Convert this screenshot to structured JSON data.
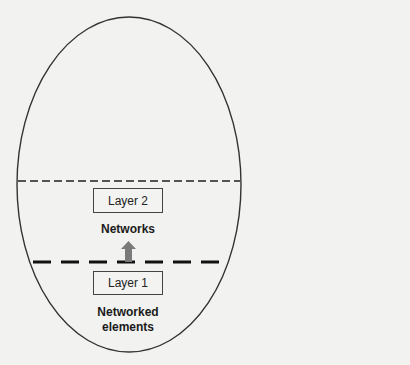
{
  "diagram": {
    "type": "layered-network-ellipse",
    "boxes": [
      {
        "id": "layer-2",
        "label": "Layer 2"
      },
      {
        "id": "layer-1",
        "label": "Layer 1"
      }
    ],
    "labels": {
      "networks": "Networks",
      "networked_elements_line1": "Networked",
      "networked_elements_line2": "elements"
    },
    "connectors": [
      {
        "from": "layer-1",
        "to": "layer-2",
        "kind": "upward-arrow",
        "color": "#7a7a7a"
      }
    ],
    "boundaries": [
      {
        "name": "upper-boundary",
        "style": "thin-dashed"
      },
      {
        "name": "lower-boundary",
        "style": "thick-dashed"
      }
    ],
    "colors": {
      "stroke": "#333333",
      "arrow": "#7a7a7a",
      "background": "#f2f2f1"
    }
  }
}
